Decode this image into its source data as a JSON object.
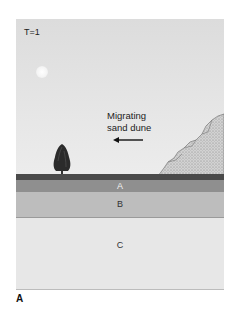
{
  "figure": {
    "time_label": "T=1",
    "dune_label_line1": "Migrating",
    "dune_label_line2": "sand dune",
    "arrow_direction": "left",
    "layers": [
      {
        "label": "A",
        "color": "#8f8f8f"
      },
      {
        "label": "B",
        "color": "#bdbdbd"
      },
      {
        "label": "C",
        "color": "#e7e7e7"
      }
    ],
    "ground_color": "#4a4a4a",
    "sky_color": "#e2e2e2"
  },
  "panel_label": "A"
}
